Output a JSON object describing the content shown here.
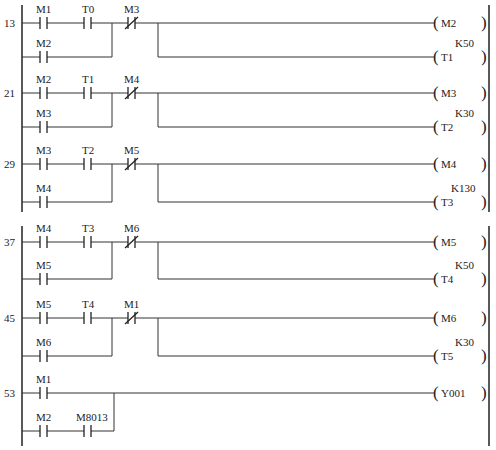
{
  "diagram": {
    "type": "PLC ladder diagram",
    "rungs": [
      {
        "step": "13",
        "series": [
          {
            "name": "M1",
            "type": "NO"
          },
          {
            "name": "T0",
            "type": "NO"
          }
        ],
        "parallel": [
          {
            "name": "M2",
            "type": "NO"
          }
        ],
        "interlock": {
          "name": "M3",
          "type": "NC"
        },
        "outputs": [
          {
            "name": "M2",
            "preset": ""
          },
          {
            "name": "T1",
            "preset": "K50"
          }
        ]
      },
      {
        "step": "21",
        "series": [
          {
            "name": "M2",
            "type": "NO"
          },
          {
            "name": "T1",
            "type": "NO"
          }
        ],
        "parallel": [
          {
            "name": "M3",
            "type": "NO"
          }
        ],
        "interlock": {
          "name": "M4",
          "type": "NC"
        },
        "outputs": [
          {
            "name": "M3",
            "preset": ""
          },
          {
            "name": "T2",
            "preset": "K30"
          }
        ]
      },
      {
        "step": "29",
        "series": [
          {
            "name": "M3",
            "type": "NO"
          },
          {
            "name": "T2",
            "type": "NO"
          }
        ],
        "parallel": [
          {
            "name": "M4",
            "type": "NO"
          }
        ],
        "interlock": {
          "name": "M5",
          "type": "NC"
        },
        "outputs": [
          {
            "name": "M4",
            "preset": ""
          },
          {
            "name": "T3",
            "preset": "K130"
          }
        ]
      },
      {
        "step": "37",
        "series": [
          {
            "name": "M4",
            "type": "NO"
          },
          {
            "name": "T3",
            "type": "NO"
          }
        ],
        "parallel": [
          {
            "name": "M5",
            "type": "NO"
          }
        ],
        "interlock": {
          "name": "M6",
          "type": "NC"
        },
        "outputs": [
          {
            "name": "M5",
            "preset": ""
          },
          {
            "name": "T4",
            "preset": "K50"
          }
        ]
      },
      {
        "step": "45",
        "series": [
          {
            "name": "M5",
            "type": "NO"
          },
          {
            "name": "T4",
            "type": "NO"
          }
        ],
        "parallel": [
          {
            "name": "M6",
            "type": "NO"
          }
        ],
        "interlock": {
          "name": "M1",
          "type": "NC"
        },
        "outputs": [
          {
            "name": "M6",
            "preset": ""
          },
          {
            "name": "T5",
            "preset": "K30"
          }
        ]
      },
      {
        "step": "53",
        "series": [
          {
            "name": "M1",
            "type": "NO"
          }
        ],
        "parallel": [
          {
            "name": "M2",
            "type": "NO"
          },
          {
            "name": "M8013",
            "type": "NO"
          }
        ],
        "outputs": [
          {
            "name": "Y001",
            "preset": ""
          }
        ]
      }
    ]
  },
  "colors": {
    "line": "#333333",
    "background": "#ffffff",
    "text": "#222222"
  }
}
